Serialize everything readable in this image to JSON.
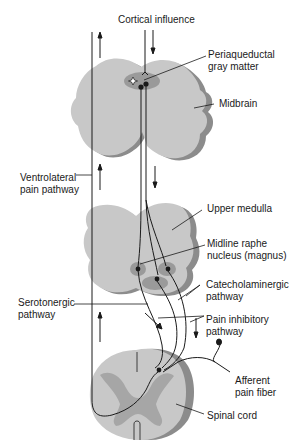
{
  "diagram": {
    "colors": {
      "tissue_fill": "#c8c8c8",
      "tissue_edge": "#8c8c8c",
      "nucleus_fill": "#9a9a9a",
      "gray_matter": "#a6a6a6",
      "line": "#1a1a1a",
      "background": "#ffffff"
    },
    "labels": {
      "cortical": "Cortical influence",
      "pag": "Periaqueductal\ngray matter",
      "midbrain": "Midbrain",
      "ventrolateral": "Ventrolateral\npain pathway",
      "upper_medulla": "Upper medulla",
      "raphe": "Midline raphe\nnucleus (magnus)",
      "catecholaminergic": "Catecholaminergic\npathway",
      "serotonergic": "Serotonergic\npathway",
      "pain_inhibitory": "Pain inhibitory\npathway",
      "afferent": "Afferent\npain fiber",
      "spinal_cord": "Spinal cord"
    },
    "structures": [
      {
        "name": "Midbrain",
        "contains": [
          "Periaqueductal gray matter"
        ]
      },
      {
        "name": "Upper medulla",
        "contains": [
          "Midline raphe nucleus (magnus)"
        ]
      },
      {
        "name": "Spinal cord",
        "contains": [
          "Dorsal horn synapse",
          "Afferent pain fiber"
        ]
      }
    ],
    "pathways": [
      {
        "name": "Cortical influence",
        "direction": "descending",
        "to": "Periaqueductal gray matter"
      },
      {
        "name": "Ventrolateral pain pathway",
        "direction": "ascending"
      },
      {
        "name": "Serotonergic pathway",
        "direction": "descending",
        "from": "Midline raphe nucleus (magnus)",
        "to": "Spinal cord"
      },
      {
        "name": "Catecholaminergic pathway",
        "direction": "descending",
        "from": "Upper medulla",
        "to": "Spinal cord"
      },
      {
        "name": "Pain inhibitory pathway",
        "direction": "descending"
      },
      {
        "name": "Afferent pain fiber",
        "direction": "incoming",
        "to": "Spinal cord"
      }
    ]
  }
}
